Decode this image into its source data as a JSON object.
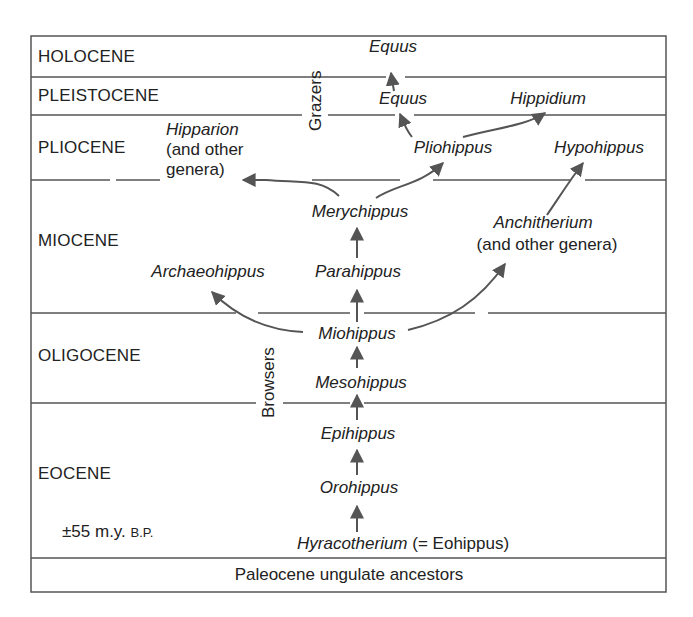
{
  "epochs": [
    {
      "name": "HOLOCENE"
    },
    {
      "name": "PLEISTOCENE"
    },
    {
      "name": "PLIOCENE"
    },
    {
      "name": "MIOCENE"
    },
    {
      "name": "OLIGOCENE"
    },
    {
      "name": "EOCENE"
    }
  ],
  "base": "Paleocene ungulate ancestors",
  "age_note": {
    "prefix": "±",
    "value": "55 m.y.",
    "suffix": "B.P."
  },
  "groups": {
    "grazers": "Grazers",
    "browsers": "Browsers"
  },
  "genera": {
    "equus_holocene": "Equus",
    "equus_pleistocene": "Equus",
    "hippidium": "Hippidium",
    "hipparion_line1": "Hipparion",
    "hipparion_line2": "(and other",
    "hipparion_line3": "genera)",
    "pliohippus": "Pliohippus",
    "hypohippus": "Hypohippus",
    "merychippus": "Merychippus",
    "anchitherium_line1": "Anchitherium",
    "anchitherium_line2": "(and other genera)",
    "archaeohippus": "Archaeohippus",
    "parahippus": "Parahippus",
    "miohippus": "Miohippus",
    "mesohippus": "Mesohippus",
    "epihippus": "Epihippus",
    "orohippus": "Orohippus",
    "hyracotherium": "Hyracotherium",
    "eohippus_note": "(= Eohippus)"
  },
  "colors": {
    "line": "#555555",
    "text": "#222222",
    "background": "#ffffff"
  }
}
